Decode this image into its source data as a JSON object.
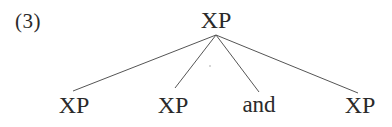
{
  "example": {
    "number": "(3)"
  },
  "tree": {
    "root": {
      "label": "XP",
      "x": 216,
      "top": 7,
      "apex": [
        216,
        35
      ]
    },
    "children": [
      {
        "label": "XP",
        "x": 74,
        "top": 92,
        "attach": [
          73,
          91
        ]
      },
      {
        "label": "XP",
        "x": 173,
        "top": 92,
        "attach": [
          175,
          88
        ]
      },
      {
        "label": "and",
        "x": 259,
        "top": 92,
        "attach": [
          259,
          92
        ]
      },
      {
        "label": "XP",
        "x": 360,
        "top": 92,
        "attach": [
          358,
          93
        ]
      }
    ],
    "line_color": "#555555"
  }
}
